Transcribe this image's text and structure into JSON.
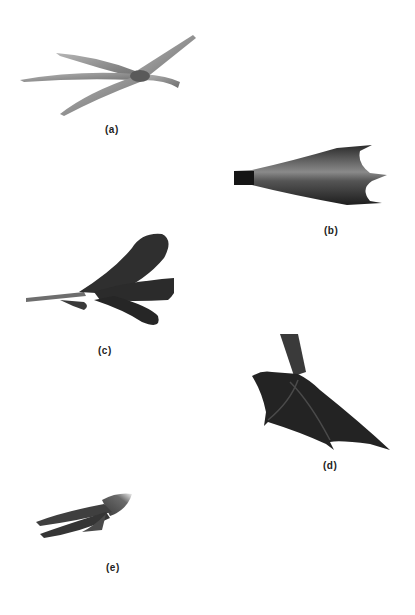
{
  "figure": {
    "panels": [
      {
        "id": "a",
        "label": "(a)",
        "description": "perching-bird foot with slender toes, light grey"
      },
      {
        "id": "b",
        "label": "(b)",
        "description": "webbed duck foot viewed from above, dark grey"
      },
      {
        "id": "c",
        "label": "(c)",
        "description": "lobed toes foot, dark"
      },
      {
        "id": "d",
        "label": "(d)",
        "description": "totipalmate webbed foot with leg, dark"
      },
      {
        "id": "e",
        "label": "(e)",
        "description": "clawed raptor-like foot, grey"
      }
    ],
    "colors": {
      "background": "#ffffff",
      "light_foot": "#8a8a8a",
      "dark_foot": "#2a2a2a",
      "label": "#222222"
    }
  }
}
